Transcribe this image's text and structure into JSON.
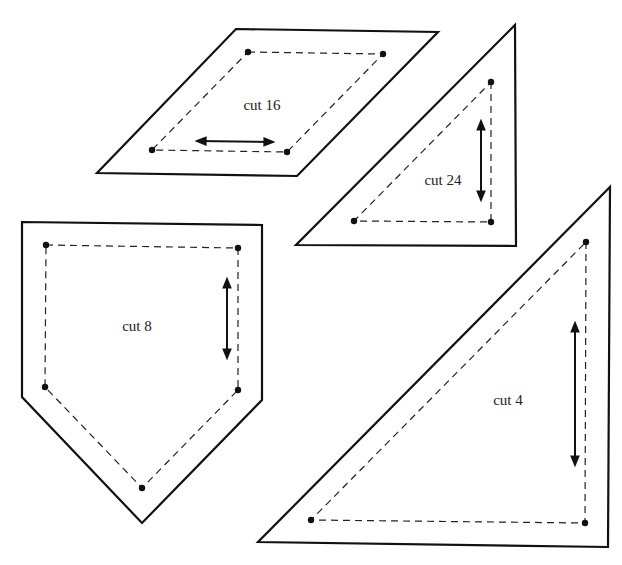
{
  "diagram": {
    "type": "quilt-pattern-templates",
    "colors": {
      "line": "#111111",
      "background": "#ffffff"
    },
    "pieces": [
      {
        "id": "parallelogram",
        "shape": "parallelogram",
        "label": "cut 16",
        "grainline": "horizontal"
      },
      {
        "id": "small-triangle",
        "shape": "right-triangle",
        "label": "cut 24",
        "grainline": "vertical"
      },
      {
        "id": "house",
        "shape": "pentagon",
        "label": "cut 8",
        "grainline": "vertical"
      },
      {
        "id": "large-triangle",
        "shape": "right-triangle",
        "label": "cut 4",
        "grainline": "vertical"
      }
    ],
    "legend_notes": {
      "solid_line": "cutting line",
      "dashed_line": "seam line",
      "dots": "seam corner points",
      "double_arrow": "grainline"
    }
  }
}
